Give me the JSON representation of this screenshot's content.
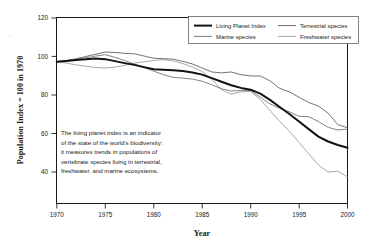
{
  "chart_data": {
    "type": "line",
    "title": "",
    "xlabel": "Year",
    "ylabel": "Population Index = 100 in 1970",
    "xlim": [
      1970,
      2000
    ],
    "ylim": [
      36,
      120
    ],
    "xticks": [
      1970,
      1975,
      1980,
      1985,
      1990,
      1995,
      2000
    ],
    "yticks": [
      40,
      60,
      80,
      100,
      120
    ],
    "grid": false,
    "legend_position": "top-right",
    "x": [
      1970,
      1971,
      1972,
      1973,
      1974,
      1975,
      1976,
      1977,
      1978,
      1979,
      1980,
      1981,
      1982,
      1983,
      1984,
      1985,
      1986,
      1987,
      1988,
      1989,
      1990,
      1991,
      1992,
      1993,
      1994,
      1995,
      1996,
      1997,
      1998,
      1999,
      2000
    ],
    "series": [
      {
        "name": "Living Planet Index",
        "color": "#121212",
        "width": "thick",
        "values": [
          100,
          100.4,
          100.8,
          101.2,
          101.5,
          101.2,
          100.3,
          99.4,
          98.6,
          97.6,
          96.6,
          96.4,
          96.2,
          95.8,
          95.2,
          94.2,
          92.6,
          91.0,
          89.4,
          88.2,
          87.4,
          85.6,
          82.8,
          79.6,
          76.4,
          73.0,
          69.6,
          66.2,
          64.0,
          62.4,
          61.2
        ]
      },
      {
        "name": "Terrestrial species",
        "color": "#5a5a5a",
        "width": "thin",
        "values": [
          100,
          100.6,
          101.4,
          102.4,
          103.4,
          104.4,
          104.2,
          103.8,
          103.6,
          102.6,
          101.6,
          101.4,
          101.2,
          100.2,
          99.0,
          97.2,
          95.4,
          95.0,
          95.4,
          94.2,
          93.6,
          93.6,
          91.4,
          88.0,
          86.4,
          84.0,
          81.6,
          80.0,
          76.8,
          71.6,
          70.2
        ]
      },
      {
        "name": "Marine species",
        "color": "#6e6e6e",
        "width": "thin",
        "values": [
          100,
          100.5,
          101.0,
          101.8,
          102.6,
          103.2,
          102.0,
          100.6,
          99.0,
          97.4,
          95.8,
          94.2,
          93.0,
          92.6,
          92.2,
          91.2,
          89.6,
          87.8,
          86.8,
          87.0,
          87.0,
          84.0,
          81.0,
          79.0,
          77.4,
          75.4,
          75.2,
          73.0,
          70.4,
          69.2,
          69.6
        ]
      },
      {
        "name": "Freshwater species",
        "color": "#9a9a9a",
        "width": "thin",
        "values": [
          100,
          99.4,
          98.6,
          98.0,
          97.4,
          97.2,
          97.6,
          98.4,
          99.4,
          100.0,
          100.6,
          101.0,
          100.4,
          99.2,
          97.6,
          95.6,
          92.0,
          87.4,
          85.4,
          86.4,
          86.6,
          83.0,
          78.0,
          73.2,
          68.6,
          63.6,
          58.4,
          53.4,
          50.2,
          50.6,
          48.0
        ]
      }
    ],
    "annotation": {
      "lines": [
        "The living planet index is an indicator",
        "of the state of the world's biodiversity:",
        "it measures trends in populations of",
        "vertebrate species living in terrestrial,",
        "freshwater, and marine ecosystems."
      ]
    }
  },
  "legend": {
    "entries": [
      {
        "label": "Living Planet Index"
      },
      {
        "label": "Terrestrial species"
      },
      {
        "label": "Marine species"
      },
      {
        "label": "Freshwater species"
      }
    ]
  },
  "axes": {
    "x_title": "Year",
    "y_title": "Population Index = 100 in 1970",
    "x_tick_labels": [
      "1970",
      "1975",
      "1980",
      "1985",
      "1990",
      "1995",
      "2000"
    ],
    "y_tick_labels": [
      "40",
      "60",
      "80",
      "100",
      "120"
    ]
  },
  "marks": {
    "margin_mark": "·"
  }
}
